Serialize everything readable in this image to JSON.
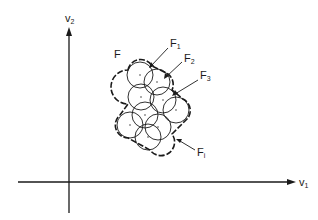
{
  "figure": {
    "axes": {
      "x_label": "v",
      "x_label_sub": "1",
      "y_label": "v",
      "y_label_sub": "2"
    },
    "set_label": "F",
    "callouts": [
      {
        "name": "F",
        "sub": "1"
      },
      {
        "name": "F",
        "sub": "2"
      },
      {
        "name": "F",
        "sub": "3"
      },
      {
        "name": "F",
        "sub": "i"
      }
    ],
    "circles": [
      {
        "cx": 140,
        "cy": 75,
        "r": 13
      },
      {
        "cx": 157,
        "cy": 82,
        "r": 13
      },
      {
        "cx": 141,
        "cy": 97,
        "r": 13
      },
      {
        "cx": 163,
        "cy": 100,
        "r": 13
      },
      {
        "cx": 145,
        "cy": 115,
        "r": 13
      },
      {
        "cx": 176,
        "cy": 110,
        "r": 13
      },
      {
        "cx": 130,
        "cy": 125,
        "r": 13
      },
      {
        "cx": 158,
        "cy": 127,
        "r": 13
      },
      {
        "cx": 148,
        "cy": 137,
        "r": 13
      }
    ],
    "colors": {
      "ink": "#1a1a1a",
      "background": "#ffffff"
    }
  }
}
